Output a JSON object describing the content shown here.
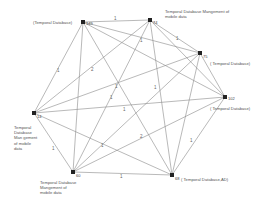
{
  "graph": {
    "nodes": [
      {
        "id": "149",
        "x": 83,
        "y": 22,
        "label": "(Temporal Database)"
      },
      {
        "id": "74",
        "x": 150,
        "y": 20,
        "label": "Temporal Database Mangement of mobile data"
      },
      {
        "id": "75",
        "x": 200,
        "y": 53,
        "label": "( Temporal Database)"
      },
      {
        "id": "102",
        "x": 225,
        "y": 97,
        "label": "( Temporal Database)"
      },
      {
        "id": "68",
        "x": 172,
        "y": 175,
        "label": "( Temporal Database,AD)"
      },
      {
        "id": "60",
        "x": 73,
        "y": 172,
        "label": "Temporal Database Mangement of mobile data"
      },
      {
        "id": "14",
        "x": 34,
        "y": 113,
        "label": "Temporal Database Man gement of mobile data"
      }
    ],
    "edge_labels": [
      "1",
      "1",
      "1",
      "1",
      "2",
      "1",
      "1",
      "1",
      "1",
      "1",
      "1",
      "2",
      "1",
      "1"
    ]
  }
}
